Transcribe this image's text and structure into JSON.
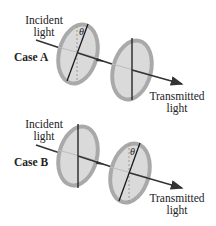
{
  "figure": {
    "cases": [
      {
        "name": "Case A",
        "incident_label": [
          "Incident",
          "light"
        ],
        "transmitted_label": [
          "Transmitted",
          "light"
        ],
        "first_polarizer": {
          "axis": "tilted",
          "angle_label": "θ"
        },
        "second_polarizer": {
          "axis": "vertical"
        }
      },
      {
        "name": "Case B",
        "incident_label": [
          "Incident",
          "light"
        ],
        "transmitted_label": [
          "Transmitted",
          "light"
        ],
        "first_polarizer": {
          "axis": "vertical"
        },
        "second_polarizer": {
          "axis": "tilted",
          "angle_label": "θ"
        }
      }
    ],
    "colors": {
      "disc_rim": "#a9a9a9",
      "disc_fill": "#dadada",
      "axis_line": "#1a1a1a",
      "beam": "#333333",
      "text": "#222222"
    }
  }
}
